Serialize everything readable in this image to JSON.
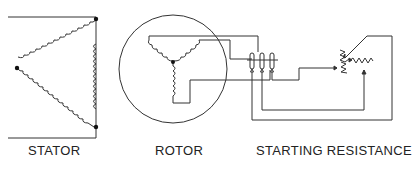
{
  "labels": {
    "stator": "STATOR",
    "rotor": "ROTOR",
    "starting_resistance": "STARTING RESISTANCE"
  },
  "colors": {
    "line": "#333333",
    "text": "#222222",
    "background": "#ffffff"
  }
}
